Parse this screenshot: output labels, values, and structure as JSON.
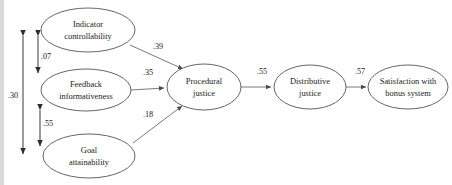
{
  "figure": {
    "type": "path-diagram",
    "title": "",
    "nodes": [
      {
        "id": "indicator_controllability",
        "label_line1": "Indicator",
        "label_line2": "controllability",
        "cx": 88,
        "cy": 30,
        "rx": 47,
        "ry": 22
      },
      {
        "id": "feedback_informativeness",
        "label_line1": "Feedback",
        "label_line2": "informativeness",
        "cx": 86,
        "cy": 90,
        "rx": 45,
        "ry": 21
      },
      {
        "id": "goal_attainability",
        "label_line1": "Goal",
        "label_line2": "attainability",
        "cx": 89,
        "cy": 156,
        "rx": 46,
        "ry": 22
      },
      {
        "id": "procedural_justice",
        "label_line1": "Procedural",
        "label_line2": "justice",
        "cx": 204,
        "cy": 87,
        "rx": 37,
        "ry": 23
      },
      {
        "id": "distributive_justice",
        "label_line1": "Distributive",
        "label_line2": "justice",
        "cx": 310,
        "cy": 87,
        "rx": 36,
        "ry": 22
      },
      {
        "id": "satisfaction_bonus",
        "label_line1": "Satisfaction with",
        "label_line2": "bonus system",
        "cx": 408,
        "cy": 87,
        "rx": 40,
        "ry": 22
      }
    ],
    "paths": [
      {
        "id": "ic_to_pj",
        "from": "indicator_controllability",
        "to": "procedural_justice",
        "coefficient": ".39",
        "label_x": 158,
        "label_y": 47
      },
      {
        "id": "fi_to_pj",
        "from": "feedback_informativeness",
        "to": "procedural_justice",
        "coefficient": ".35",
        "label_x": 148,
        "label_y": 73
      },
      {
        "id": "ga_to_pj",
        "from": "goal_attainability",
        "to": "procedural_justice",
        "coefficient": ".18",
        "label_x": 148,
        "label_y": 115
      },
      {
        "id": "pj_to_dj",
        "from": "procedural_justice",
        "to": "distributive_justice",
        "coefficient": ".55",
        "label_x": 262,
        "label_y": 72
      },
      {
        "id": "dj_to_sat",
        "from": "distributive_justice",
        "to": "satisfaction_bonus",
        "coefficient": ".57",
        "label_x": 360,
        "label_y": 72
      }
    ],
    "correlations": [
      {
        "id": "ic_ga_corr",
        "between": [
          "indicator_controllability",
          "goal_attainability"
        ],
        "coefficient": ".30",
        "label_x": 13,
        "label_y": 96
      },
      {
        "id": "ic_fi_corr",
        "between": [
          "indicator_controllability",
          "feedback_informativeness"
        ],
        "coefficient": ".07",
        "label_x": 46,
        "label_y": 57
      },
      {
        "id": "fi_ga_corr",
        "between": [
          "feedback_informativeness",
          "goal_attainability"
        ],
        "coefficient": ".55",
        "label_x": 48,
        "label_y": 124
      }
    ],
    "colors": {
      "node_stroke": "#555555",
      "path_stroke": "#6b6b6b",
      "correlation_stroke": "#4a4a4a",
      "text": "#1a1a1a",
      "background": "#ffffff",
      "left_bar": "#d9d9d9"
    }
  }
}
